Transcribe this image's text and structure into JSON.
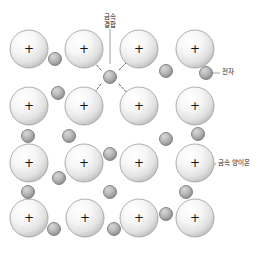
{
  "diagram": {
    "background_color": "#ffffff",
    "width": 260,
    "height": 256,
    "colors": {
      "cation_fill_light": "#fdfdfd",
      "cation_fill_dark": "#c9c9c9",
      "cation_stroke": "#9a9a9a",
      "electron_fill_light": "#c8c8c8",
      "electron_fill_dark": "#8d8d8d",
      "electron_stroke": "#6f6f6f",
      "bond_line": "#555555",
      "leader_line": "#888888",
      "text": "#1a1a1a"
    },
    "labels": [
      {
        "id": "metallic-bond",
        "text_line1": "금속",
        "text_line2": "결합",
        "x": 110,
        "y": 14,
        "leader": {
          "x1": 110,
          "y1": 29,
          "x2": 110,
          "y2": 64
        }
      },
      {
        "id": "electron",
        "text_line1": "전자",
        "text_line2": "",
        "x": 222,
        "y": 69,
        "leader": {
          "x1": 212,
          "y1": 73,
          "x2": 220,
          "y2": 73
        }
      },
      {
        "id": "metal-cation",
        "text_line1": "금속 양이온",
        "text_line2": "",
        "x": 218,
        "y": 160,
        "leader": {
          "x1": 206,
          "y1": 164,
          "x2": 216,
          "y2": 164
        }
      }
    ],
    "cations": {
      "symbol": "+",
      "radius": 19,
      "positions": [
        {
          "cx": 29,
          "cy": 49
        },
        {
          "cx": 84,
          "cy": 49
        },
        {
          "cx": 139,
          "cy": 49
        },
        {
          "cx": 195,
          "cy": 49
        },
        {
          "cx": 29,
          "cy": 106
        },
        {
          "cx": 84,
          "cy": 106
        },
        {
          "cx": 139,
          "cy": 106
        },
        {
          "cx": 195,
          "cy": 106
        },
        {
          "cx": 29,
          "cy": 163
        },
        {
          "cx": 84,
          "cy": 163
        },
        {
          "cx": 139,
          "cy": 163
        },
        {
          "cx": 195,
          "cy": 163
        },
        {
          "cx": 29,
          "cy": 218
        },
        {
          "cx": 85,
          "cy": 218
        },
        {
          "cx": 139,
          "cy": 218
        },
        {
          "cx": 195,
          "cy": 218
        }
      ]
    },
    "electrons": {
      "radius": 6.5,
      "positions": [
        {
          "cx": 55,
          "cy": 59
        },
        {
          "cx": 110,
          "cy": 77
        },
        {
          "cx": 166,
          "cy": 71
        },
        {
          "cx": 206,
          "cy": 73
        },
        {
          "cx": 58,
          "cy": 93
        },
        {
          "cx": 28,
          "cy": 136
        },
        {
          "cx": 69,
          "cy": 136
        },
        {
          "cx": 166,
          "cy": 139
        },
        {
          "cx": 198,
          "cy": 134
        },
        {
          "cx": 110,
          "cy": 154
        },
        {
          "cx": 59,
          "cy": 178
        },
        {
          "cx": 28,
          "cy": 192
        },
        {
          "cx": 110,
          "cy": 192
        },
        {
          "cx": 186,
          "cy": 192
        },
        {
          "cx": 54,
          "cy": 229
        },
        {
          "cx": 114,
          "cy": 229
        },
        {
          "cx": 166,
          "cy": 214
        }
      ]
    },
    "bonds": [
      {
        "x1": 101,
        "y1": 70,
        "x2": 94,
        "y2": 62
      },
      {
        "x1": 119,
        "y1": 70,
        "x2": 127,
        "y2": 62
      },
      {
        "x1": 101,
        "y1": 84,
        "x2": 94,
        "y2": 93
      },
      {
        "x1": 119,
        "y1": 84,
        "x2": 127,
        "y2": 93
      }
    ]
  }
}
